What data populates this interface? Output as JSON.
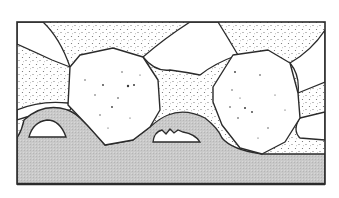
{
  "figure": {
    "colors": {
      "outline": "#2b2b2b",
      "background": "#ffffff",
      "ground_fill": "#c8c8c8",
      "stipple": "#6a6a6a",
      "speckle": "#3a3a3a"
    },
    "elements": [
      {
        "name": "frame",
        "label": ""
      },
      {
        "name": "stippled-matrix",
        "label": ""
      },
      {
        "name": "clear-grains",
        "label": ""
      },
      {
        "name": "boulder-left",
        "label": ""
      },
      {
        "name": "boulder-right",
        "label": ""
      },
      {
        "name": "gray-base-layer",
        "label": ""
      },
      {
        "name": "cavity-left",
        "label": ""
      },
      {
        "name": "cavity-middle",
        "label": ""
      }
    ]
  }
}
